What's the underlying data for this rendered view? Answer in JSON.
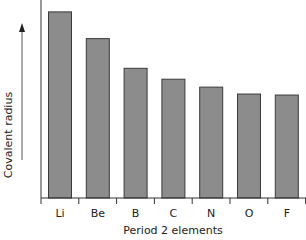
{
  "chart_data": {
    "type": "bar",
    "title": "",
    "xlabel": "Period 2 elements",
    "ylabel": "Covalent radius",
    "categories": [
      "Li",
      "Be",
      "B",
      "C",
      "N",
      "O",
      "F"
    ],
    "values": [
      188,
      161,
      131,
      120,
      112,
      105,
      104
    ],
    "value_units": "relative (pixel-scale, no numeric axis shown)",
    "ylim": [
      0,
      200
    ],
    "grid": false,
    "legend": null,
    "y_axis_arrow": true,
    "bar_color": "#8c8c8c",
    "bar_edge_color": "#3a3a3a"
  }
}
